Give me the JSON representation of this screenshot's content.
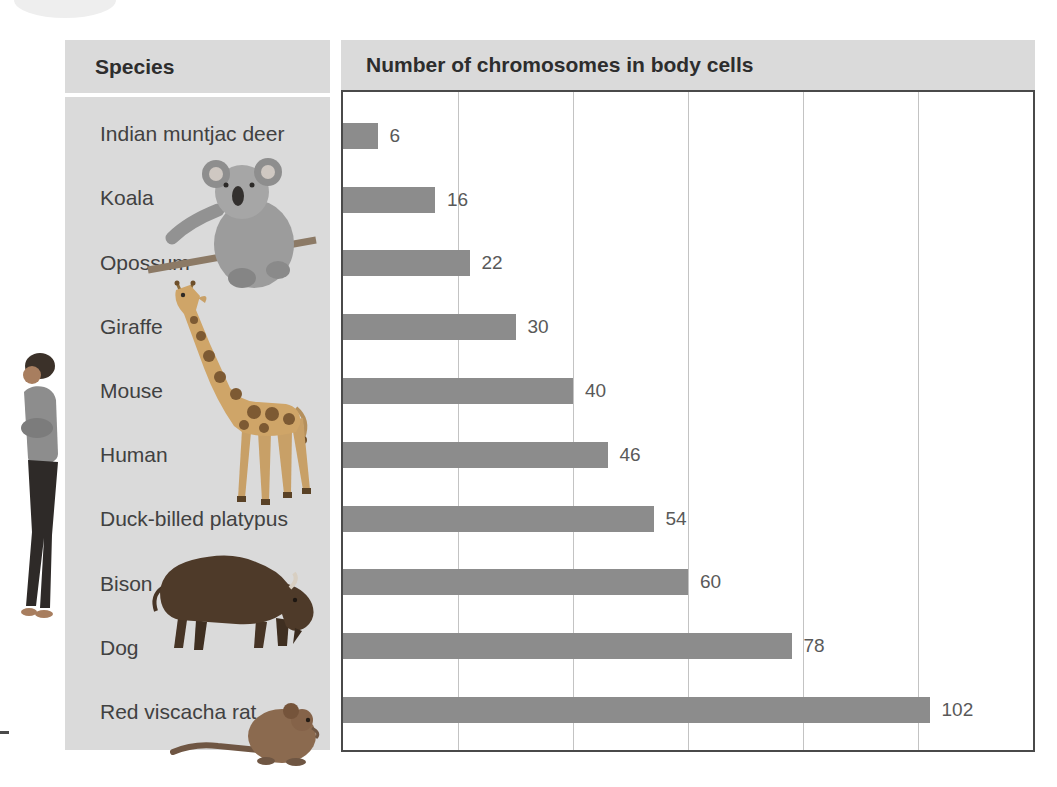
{
  "figure": {
    "species_header": "Species",
    "chart_header": "Number of chromosomes in body cells"
  },
  "chart_data": {
    "type": "bar",
    "orientation": "horizontal",
    "title": "Number of chromosomes in body cells",
    "categories_label": "Species",
    "categories": [
      "Indian muntjac deer",
      "Koala",
      "Opossum",
      "Giraffe",
      "Mouse",
      "Human",
      "Duck-billed platypus",
      "Bison",
      "Dog",
      "Red viscacha rat"
    ],
    "values": [
      6,
      16,
      22,
      30,
      40,
      46,
      54,
      60,
      78,
      102
    ],
    "xlim": [
      0,
      120
    ],
    "gridlines": [
      20,
      40,
      60,
      80,
      100
    ],
    "grid": "vertical lines only, no tick labels",
    "legend_position": "none",
    "value_labels_shown": true
  },
  "images": {
    "person": "standing-woman-photo",
    "koala": "koala-photo",
    "giraffe": "giraffe-photo",
    "bison": "bison-photo",
    "rat": "red-viscacha-rat-photo"
  },
  "colors": {
    "panel_bg": "#dadada",
    "bar": "#8c8c8c",
    "gridline": "#c3c3c3",
    "plot_border": "#4a4a4a",
    "header_text": "#2d2d2d",
    "label_text": "#414141",
    "value_text": "#595959"
  }
}
